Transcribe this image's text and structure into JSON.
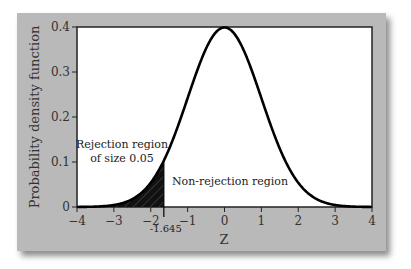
{
  "chart_data": {
    "type": "line",
    "title": "",
    "xlabel": "Z",
    "ylabel": "Probability density function",
    "xlim": [
      -4,
      4
    ],
    "ylim": [
      0,
      0.4
    ],
    "x_ticks": [
      "-4",
      "-3",
      "-2",
      "-1",
      "0",
      "1",
      "2",
      "3",
      "4"
    ],
    "y_ticks": [
      "0",
      "0.1",
      "0.2",
      "0.3",
      "0.4"
    ],
    "series": [
      {
        "name": "Standard normal density",
        "x": [
          -4,
          -3.5,
          -3,
          -2.5,
          -2,
          -1.645,
          -1.5,
          -1,
          -0.5,
          0,
          0.5,
          1,
          1.5,
          2,
          2.5,
          3,
          3.5,
          4
        ],
        "values": [
          0.0001,
          0.0009,
          0.0044,
          0.0175,
          0.054,
          0.1031,
          0.1295,
          0.242,
          0.3521,
          0.3989,
          0.3521,
          0.242,
          0.1295,
          0.054,
          0.0175,
          0.0044,
          0.0009,
          0.0001
        ]
      }
    ],
    "critical_value": -1.645,
    "critical_value_label": "-1.645",
    "shaded_region": {
      "from": -4,
      "to": -1.645,
      "style": "black with diagonal hatch"
    },
    "annotations": [
      {
        "text_line1": "Rejection region",
        "text_line2": "of size 0.05",
        "region": "left tail"
      },
      {
        "text": "Non-rejection region",
        "region": "right of critical value"
      }
    ],
    "grid": false,
    "legend": "none"
  },
  "colors": {
    "panel": "#b9b9b9",
    "plot_bg": "#ffffff",
    "curve": "#000000",
    "shade": "#111111"
  }
}
